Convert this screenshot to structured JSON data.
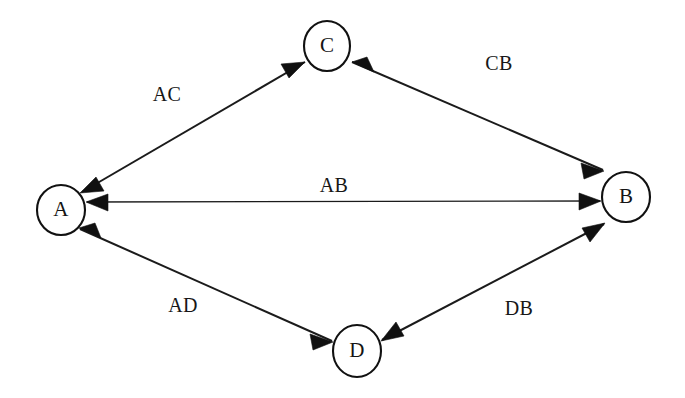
{
  "diagram": {
    "background_color": "#ffffff",
    "stroke_color": "#111111",
    "text_color": "#171717",
    "nodes": [
      {
        "id": "A",
        "label": "A",
        "cx": 61,
        "cy": 210,
        "r": 24
      },
      {
        "id": "B",
        "label": "B",
        "cx": 626,
        "cy": 197,
        "r": 24
      },
      {
        "id": "C",
        "label": "C",
        "cx": 327,
        "cy": 46,
        "r": 24
      },
      {
        "id": "D",
        "label": "D",
        "cx": 357,
        "cy": 351,
        "r": 24
      }
    ],
    "edges": [
      {
        "id": "AC",
        "label": "AC",
        "from": "A",
        "to": "C",
        "bidirectional": true,
        "label_x": 167,
        "label_y": 96
      },
      {
        "id": "CB",
        "label": "CB",
        "from": "C",
        "to": "B",
        "bidirectional": true,
        "label_x": 499,
        "label_y": 65
      },
      {
        "id": "AB",
        "label": "AB",
        "from": "A",
        "to": "B",
        "bidirectional": true,
        "label_x": 334,
        "label_y": 187
      },
      {
        "id": "AD",
        "label": "AD",
        "from": "A",
        "to": "D",
        "bidirectional": true,
        "label_x": 183,
        "label_y": 307
      },
      {
        "id": "DB",
        "label": "DB",
        "from": "D",
        "to": "B",
        "bidirectional": true,
        "label_x": 519,
        "label_y": 310
      }
    ]
  }
}
